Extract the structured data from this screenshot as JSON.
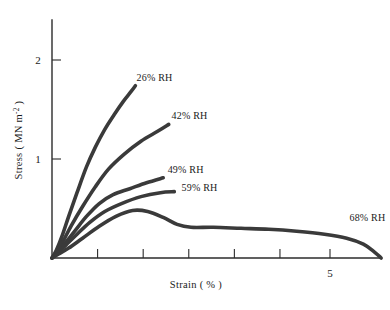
{
  "chart_data": {
    "type": "line",
    "title": "",
    "xlabel": "Strain ( % )",
    "ylabel": "Stress ( MN m-2 )",
    "ylabel_parts": {
      "prefix": "Stress ( MN m",
      "superscript": "-2",
      "suffix": " )"
    },
    "xlim": [
      0,
      7
    ],
    "ylim": [
      0,
      2.4
    ],
    "grid": false,
    "legend_position": "inline-annotations",
    "y_ticks": [
      {
        "value": 1,
        "label": "1"
      },
      {
        "value": 2,
        "label": "2"
      }
    ],
    "x_ticks": [
      {
        "value": 0,
        "label": ""
      },
      {
        "value": 0.82,
        "label": ""
      },
      {
        "value": 1.64,
        "label": ""
      },
      {
        "value": 2.46,
        "label": ""
      },
      {
        "value": 3.28,
        "label": ""
      },
      {
        "value": 4.1,
        "label": ""
      },
      {
        "value": 5,
        "label": "5"
      }
    ],
    "series": [
      {
        "name": "26% RH",
        "label": "26% RH",
        "label_position": {
          "x": 1.52,
          "y": 1.79
        },
        "points": [
          [
            0.0,
            0.0
          ],
          [
            0.08,
            0.08
          ],
          [
            0.18,
            0.22
          ],
          [
            0.3,
            0.42
          ],
          [
            0.45,
            0.66
          ],
          [
            0.62,
            0.92
          ],
          [
            0.78,
            1.12
          ],
          [
            0.95,
            1.3
          ],
          [
            1.12,
            1.45
          ],
          [
            1.28,
            1.58
          ],
          [
            1.42,
            1.68
          ],
          [
            1.5,
            1.74
          ]
        ]
      },
      {
        "name": "42% RH",
        "label": "42% RH",
        "label_position": {
          "x": 2.15,
          "y": 1.4
        },
        "points": [
          [
            0.0,
            0.0
          ],
          [
            0.08,
            0.06
          ],
          [
            0.2,
            0.17
          ],
          [
            0.35,
            0.33
          ],
          [
            0.55,
            0.52
          ],
          [
            0.78,
            0.72
          ],
          [
            1.02,
            0.9
          ],
          [
            1.3,
            1.05
          ],
          [
            1.6,
            1.18
          ],
          [
            1.9,
            1.28
          ],
          [
            2.1,
            1.35
          ]
        ]
      },
      {
        "name": "49% RH",
        "label": "49% RH",
        "label_position": {
          "x": 2.08,
          "y": 0.86
        },
        "points": [
          [
            0.0,
            0.0
          ],
          [
            0.1,
            0.06
          ],
          [
            0.25,
            0.16
          ],
          [
            0.42,
            0.28
          ],
          [
            0.62,
            0.42
          ],
          [
            0.85,
            0.55
          ],
          [
            1.1,
            0.64
          ],
          [
            1.4,
            0.7
          ],
          [
            1.7,
            0.76
          ],
          [
            2.0,
            0.81
          ]
        ]
      },
      {
        "name": "59% RH",
        "label": "59% RH",
        "label_position": {
          "x": 2.33,
          "y": 0.68
        },
        "points": [
          [
            0.0,
            0.0
          ],
          [
            0.1,
            0.05
          ],
          [
            0.25,
            0.13
          ],
          [
            0.45,
            0.24
          ],
          [
            0.68,
            0.36
          ],
          [
            0.95,
            0.47
          ],
          [
            1.25,
            0.55
          ],
          [
            1.6,
            0.62
          ],
          [
            1.95,
            0.66
          ],
          [
            2.2,
            0.67
          ]
        ]
      },
      {
        "name": "68% RH",
        "label": "68% RH",
        "label_position": {
          "x": 5.35,
          "y": 0.37
        },
        "points": [
          [
            0.0,
            0.0
          ],
          [
            0.12,
            0.04
          ],
          [
            0.3,
            0.1
          ],
          [
            0.55,
            0.2
          ],
          [
            0.85,
            0.32
          ],
          [
            1.15,
            0.42
          ],
          [
            1.45,
            0.48
          ],
          [
            1.72,
            0.47
          ],
          [
            2.0,
            0.41
          ],
          [
            2.25,
            0.34
          ],
          [
            2.5,
            0.31
          ],
          [
            2.9,
            0.31
          ],
          [
            3.4,
            0.3
          ],
          [
            3.9,
            0.29
          ],
          [
            4.4,
            0.27
          ],
          [
            4.9,
            0.24
          ],
          [
            5.3,
            0.2
          ],
          [
            5.6,
            0.14
          ],
          [
            5.8,
            0.06
          ],
          [
            5.92,
            0.0
          ]
        ]
      }
    ]
  }
}
